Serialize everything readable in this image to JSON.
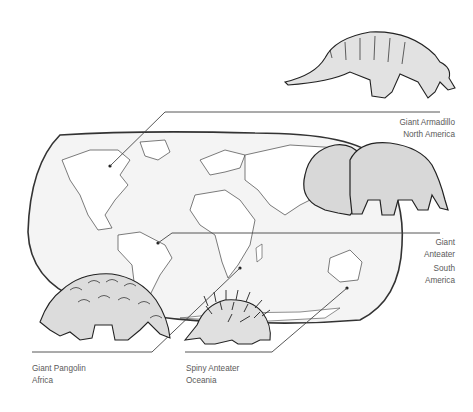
{
  "diagram": {
    "type": "world-map-species-distribution",
    "colors": {
      "line": "#333333",
      "map_fill": "#f4f4f4",
      "animal_fill": "#dcdcdc",
      "text": "#5a5a5a"
    },
    "callouts": [
      {
        "id": "armadillo",
        "name": "Giant Armadillo",
        "region": "North America"
      },
      {
        "id": "anteater",
        "name_line1": "Giant",
        "name_line2": "Anteater",
        "region_line1": "South",
        "region_line2": "America"
      },
      {
        "id": "pangolin",
        "name": "Giant Pangolin",
        "region": "Africa"
      },
      {
        "id": "echidna",
        "name": "Spiny Anteater",
        "region": "Oceania"
      }
    ]
  }
}
